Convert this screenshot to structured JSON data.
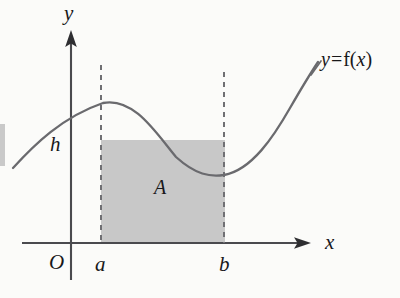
{
  "figure": {
    "background_color": "#fbfbf9",
    "ink_color": "#4a4a4e",
    "text_color": "#18181a",
    "shade_color": "#c8c8c8"
  },
  "labels": {
    "y_axis": "y",
    "x_axis": "x",
    "origin": "O",
    "height": "h",
    "lower_limit": "a",
    "upper_limit": "b",
    "area": "A",
    "curve_var": "y",
    "curve_equals": "=",
    "curve_fn": "f(",
    "curve_fn_arg": "x",
    "curve_fn_close": ")"
  },
  "chart_data": {
    "type": "line",
    "title": "",
    "xlabel": "x",
    "ylabel": "y",
    "series": [
      {
        "name": "y = f(x)",
        "path_points": [
          [
            13,
            168
          ],
          [
            30,
            150
          ],
          [
            48,
            134
          ],
          [
            66,
            120
          ],
          [
            84,
            109
          ],
          [
            103,
            103
          ],
          [
            120,
            107
          ],
          [
            138,
            120
          ],
          [
            156,
            137
          ],
          [
            174,
            154
          ],
          [
            192,
            167
          ],
          [
            210,
            174
          ],
          [
            224,
            175
          ],
          [
            240,
            170
          ],
          [
            256,
            157
          ],
          [
            272,
            137
          ],
          [
            288,
            112
          ],
          [
            303,
            88
          ],
          [
            318,
            62
          ]
        ]
      }
    ],
    "shaded_region": {
      "label": "A",
      "x_from": "a",
      "x_to": "b",
      "top": "h",
      "x_from_px": 101,
      "x_to_px": 225,
      "top_px": 140,
      "bottom_px": 243,
      "fill": "#c8c8c8"
    },
    "guides": [
      {
        "name": "dashed-line-a",
        "x_px": 101,
        "y_top_px": 65,
        "y_bottom_px": 243
      },
      {
        "name": "dashed-line-b",
        "x_px": 224,
        "y_top_px": 72,
        "y_bottom_px": 243
      }
    ],
    "axes": {
      "y_axis_x_px": 71,
      "y_axis_top_px": 30,
      "y_axis_bottom_px": 280,
      "x_axis_y_px": 243,
      "x_axis_left_px": 22,
      "x_axis_right_px": 311,
      "grid": false,
      "legend": "none"
    }
  }
}
